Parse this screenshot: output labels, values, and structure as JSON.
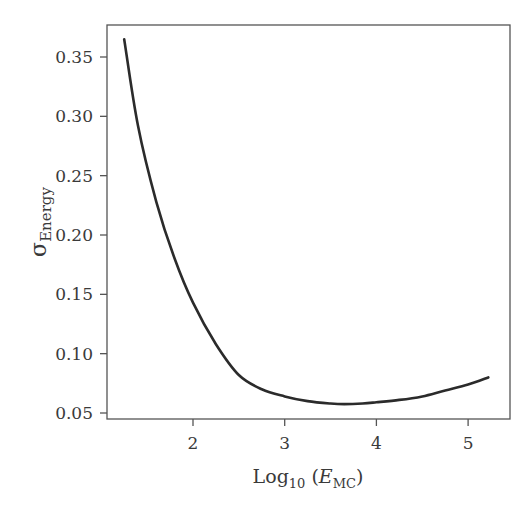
{
  "chart_data": {
    "type": "line",
    "title": "",
    "xlabel": "Log10 (E_MC)",
    "xlabel_parts": {
      "main": "Log",
      "sub": "10",
      "open": " (",
      "var": "E",
      "var_sub": "MC",
      "close": ")"
    },
    "ylabel": "σ_Energy",
    "ylabel_parts": {
      "main": "σ",
      "sub": "Energy"
    },
    "xlim": [
      1.05,
      5.45
    ],
    "ylim": [
      0.045,
      0.375
    ],
    "xticks": [
      2,
      3,
      4,
      5
    ],
    "xtick_labels": [
      "2",
      "3",
      "4",
      "5"
    ],
    "yticks": [
      0.05,
      0.1,
      0.15,
      0.2,
      0.25,
      0.3,
      0.35
    ],
    "ytick_labels": [
      "0.05",
      "0.10",
      "0.15",
      "0.20",
      "0.25",
      "0.30",
      "0.35"
    ],
    "grid": false,
    "legend": null,
    "series": [
      {
        "name": "σ_Energy",
        "color": "#2b2b2b",
        "x": [
          1.25,
          1.4,
          1.6,
          1.8,
          2.0,
          2.25,
          2.5,
          2.75,
          3.0,
          3.25,
          3.5,
          3.65,
          3.85,
          4.0,
          4.25,
          4.5,
          4.75,
          5.0,
          5.22
        ],
        "y": [
          0.365,
          0.292,
          0.228,
          0.18,
          0.143,
          0.108,
          0.082,
          0.07,
          0.064,
          0.06,
          0.058,
          0.0575,
          0.058,
          0.059,
          0.061,
          0.064,
          0.069,
          0.074,
          0.08
        ]
      }
    ]
  }
}
